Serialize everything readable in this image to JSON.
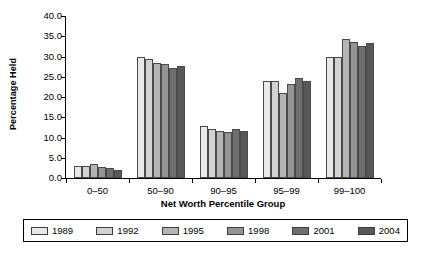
{
  "chart_data": {
    "type": "bar",
    "title": "",
    "xlabel": "Net Worth Percentile Group",
    "ylabel": "Percentage Held",
    "categories": [
      "0–50",
      "50–90",
      "90–95",
      "95–99",
      "99–100"
    ],
    "ylim": [
      0,
      40
    ],
    "yticks": [
      "0.0",
      "5.0",
      "10.0",
      "15.0",
      "20.0",
      "25.0",
      "30.0",
      "35.0",
      "40.0"
    ],
    "ytick_values": [
      0,
      5,
      10,
      15,
      20,
      25,
      30,
      35,
      40
    ],
    "grid": false,
    "legend_position": "bottom",
    "series": [
      {
        "name": "1989",
        "color": "#e8e8e8",
        "values": [
          2.9,
          29.8,
          12.9,
          23.9,
          29.8
        ]
      },
      {
        "name": "1992",
        "color": "#d2d2d2",
        "values": [
          3.0,
          29.3,
          12.2,
          24.0,
          30.0
        ]
      },
      {
        "name": "1995",
        "color": "#b4b4b4",
        "values": [
          3.4,
          28.3,
          11.5,
          20.9,
          34.3
        ]
      },
      {
        "name": "1998",
        "color": "#949494",
        "values": [
          2.8,
          28.1,
          11.3,
          23.2,
          33.6
        ]
      },
      {
        "name": "2001",
        "color": "#6e6e6e",
        "values": [
          2.5,
          27.2,
          12.0,
          24.8,
          32.6
        ]
      },
      {
        "name": "2004",
        "color": "#585858",
        "values": [
          2.1,
          27.6,
          11.6,
          23.9,
          33.3
        ]
      }
    ]
  },
  "axes": {
    "ylabel": "Percentage Held",
    "xlabel": "Net Worth Percentile Group"
  },
  "legend": {
    "items": [
      {
        "label": "1989"
      },
      {
        "label": "1992"
      },
      {
        "label": "1995"
      },
      {
        "label": "1998"
      },
      {
        "label": "2001"
      },
      {
        "label": "2004"
      }
    ]
  }
}
